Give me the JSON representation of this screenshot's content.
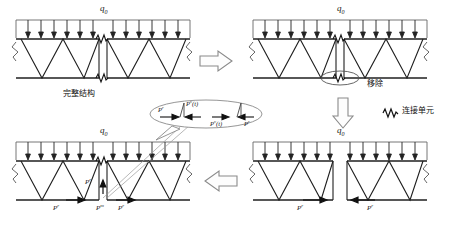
{
  "figure": {
    "title": "",
    "colors": {
      "line": "#1a1a1a",
      "chord": "#2b2b2b",
      "load_line": "#555555",
      "arrow_fill": "#ffffff",
      "arrow_stroke": "#6e6e6e",
      "text": "#111111",
      "bubble_stroke": "#777777",
      "leader": "#8a8a8a"
    }
  },
  "panels": {
    "top_left": {
      "name": "complete-structure",
      "caption": "完整结构",
      "load_label": "q",
      "load_sub": "0",
      "has_connection_element": true,
      "connection_count": 2,
      "load_arrow_count": 13,
      "truss_bays": 6
    },
    "top_right": {
      "name": "element-removal",
      "callout": "移除",
      "load_label": "q",
      "load_sub": "0",
      "has_removal_ellipse": true,
      "load_arrow_count": 13,
      "truss_bays": 6
    },
    "bottom_right": {
      "name": "separated-substructures",
      "load_label": "q",
      "load_sub": "0",
      "force_labels": [
        "P",
        "P"
      ],
      "force_sup": "r",
      "segments": 2,
      "load_arrow_count": 12
    },
    "bottom_left": {
      "name": "reassembled-with-forces",
      "load_label": "q",
      "load_sub": "0",
      "force_labels": [
        "P",
        "P",
        "P"
      ],
      "force_sup_left": "r",
      "force_sup_mid": "m",
      "force_sup_right": "r",
      "vertical_force_label": "P",
      "vertical_force_sup": "r",
      "load_arrow_count": 13
    }
  },
  "bubble": {
    "name": "force-detail-callout",
    "labels": [
      {
        "base": "P",
        "sup": "r"
      },
      {
        "base": "P",
        "sup": "v",
        "arg": "(t)"
      },
      {
        "base": "P",
        "sup": "v",
        "arg": "(t)"
      },
      {
        "base": "P",
        "sup": "r"
      }
    ]
  },
  "legend": {
    "name": "connection-element-legend",
    "symbol": "spring-zigzag",
    "label": "连接单元"
  },
  "flow_arrows": {
    "top": {
      "name": "flow-arrow-right",
      "direction": "right"
    },
    "right": {
      "name": "flow-arrow-down",
      "direction": "down"
    },
    "bottom": {
      "name": "flow-arrow-left",
      "direction": "left"
    }
  }
}
